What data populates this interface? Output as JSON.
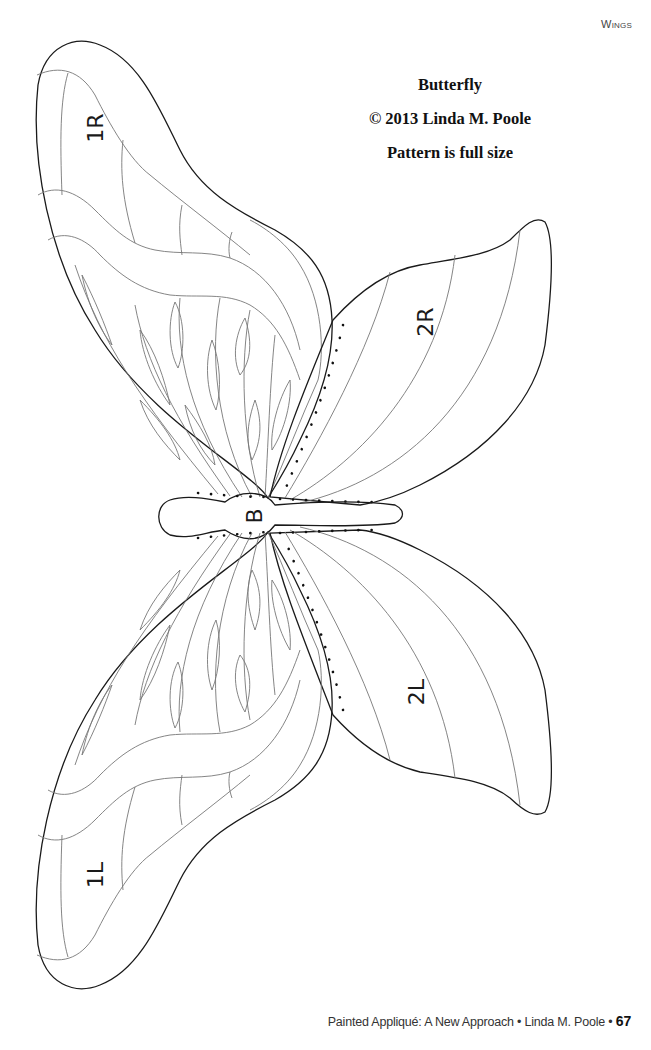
{
  "page": {
    "running_head": "Wings",
    "title_lines": [
      "Butterfly",
      "© 2013 Linda M. Poole",
      "Pattern is full size"
    ],
    "footer": {
      "text": "Painted Appliqué: A New Approach • Linda M. Poole • ",
      "page_number": "67"
    }
  },
  "pattern": {
    "pieces": [
      {
        "id": "1R",
        "label": "1R",
        "description": "upper right forewing"
      },
      {
        "id": "2R",
        "label": "2R",
        "description": "right hindwing"
      },
      {
        "id": "B",
        "label": "B",
        "description": "body"
      },
      {
        "id": "2L",
        "label": "2L",
        "description": "left hindwing"
      },
      {
        "id": "1L",
        "label": "1L",
        "description": "lower left forewing"
      }
    ],
    "colors": {
      "outline": "#1a1a1a",
      "inner_lines": "#777777",
      "background": "#ffffff"
    }
  }
}
